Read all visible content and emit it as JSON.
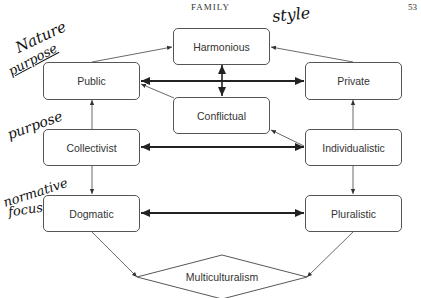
{
  "page": {
    "running_header": "FAMILY",
    "page_number": "53"
  },
  "nodes": {
    "harmonious": "Harmonious",
    "conflictual": "Conflictual",
    "public": "Public",
    "private": "Private",
    "collectivist": "Collectivist",
    "individualistic": "Individualistic",
    "dogmatic": "Dogmatic",
    "pluralistic": "Pluralistic",
    "multiculturalism": "Multiculturalism"
  },
  "annotations": {
    "style": "style",
    "nature_purpose_1": "Nature",
    "nature_purpose_2": "purpose",
    "purpose": "purpose",
    "normative_1": "normative",
    "normative_2": "focus"
  },
  "edges": [
    {
      "from": "public",
      "to": "harmonious",
      "type": "thin-arrow"
    },
    {
      "from": "private",
      "to": "harmonious",
      "type": "thin-arrow"
    },
    {
      "from": "public",
      "to": "private",
      "type": "thick-double-arrow"
    },
    {
      "from": "harmonious",
      "to": "conflictual",
      "type": "thick-double-arrow"
    },
    {
      "from": "conflictual",
      "to": "public",
      "type": "thin-arrow"
    },
    {
      "from": "individualistic",
      "to": "conflictual",
      "type": "thin-arrow"
    },
    {
      "from": "collectivist",
      "to": "individualistic",
      "type": "thick-double-arrow"
    },
    {
      "from": "collectivist",
      "to": "public",
      "type": "thin-arrow"
    },
    {
      "from": "individualistic",
      "to": "private",
      "type": "thin-arrow"
    },
    {
      "from": "collectivist",
      "to": "dogmatic",
      "type": "thin-arrow"
    },
    {
      "from": "individualistic",
      "to": "pluralistic",
      "type": "thin-arrow"
    },
    {
      "from": "dogmatic",
      "to": "pluralistic",
      "type": "thick-double-arrow"
    },
    {
      "from": "dogmatic",
      "to": "multiculturalism",
      "type": "thin-arrow"
    },
    {
      "from": "pluralistic",
      "to": "multiculturalism",
      "type": "thin-arrow"
    }
  ]
}
